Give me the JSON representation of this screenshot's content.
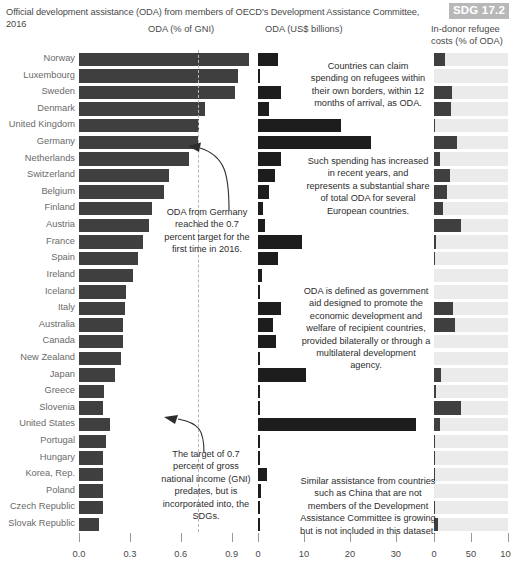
{
  "header": {
    "title": "Official development assistance (ODA) from members of OECD's Development Assistance Committee, 2016",
    "sdg_badge": "SDG 17.2"
  },
  "columns": {
    "gni": "ODA (% of GNI)",
    "usd": "ODA (US$ billions)",
    "refugee": "In-donor refugee costs (% of ODA)"
  },
  "notes": {
    "germany": "ODA from Germany reached the 0.7 percent target for the first time in 2016.",
    "target": "The target of 0.7 percent of gross national income (GNI) predates, but is incorporated into, the SDGs.",
    "refugees": "Countries can claim spending on refugees within their own borders, within 12 months of arrival, as ODA.",
    "spending": "Such spending has increased in recent years, and represents a substantial share of total ODA for several European countries.",
    "defined": "ODA is defined as government aid designed to promote the economic development and welfare of recipient countries, provided bilaterally or through a multilateral development agency.",
    "similar": "Similar assistance from countries such as China that are not members of the Development Assistance Committee is growing but is not included in this dataset."
  },
  "chart_data": {
    "type": "bar",
    "title": "Official development assistance (ODA) from members of OECD's Development Assistance Committee, 2016",
    "orientation": "horizontal",
    "categories": [
      "Norway",
      "Luxembourg",
      "Sweden",
      "Denmark",
      "United Kingdom",
      "Germany",
      "Netherlands",
      "Switzerland",
      "Belgium",
      "Finland",
      "Austria",
      "France",
      "Spain",
      "Ireland",
      "Iceland",
      "Italy",
      "Australia",
      "Canada",
      "New Zealand",
      "Japan",
      "Greece",
      "Slovenia",
      "United States",
      "Portugal",
      "Hungary",
      "Korea, Rep.",
      "Poland",
      "Czech Republic",
      "Slovak Republic"
    ],
    "panels": [
      {
        "name": "oda_pct_gni",
        "label": "ODA (% of GNI)",
        "xlabel": "",
        "ticks": [
          "0.0",
          "0.3",
          "0.6",
          "0.9"
        ],
        "tick_values": [
          0.0,
          0.3,
          0.6,
          0.9
        ],
        "xlim": [
          0,
          1.02
        ],
        "reference_line": 0.7,
        "values": [
          1.0,
          0.94,
          0.92,
          0.74,
          0.71,
          0.7,
          0.65,
          0.53,
          0.5,
          0.43,
          0.41,
          0.38,
          0.35,
          0.32,
          0.28,
          0.27,
          0.26,
          0.26,
          0.25,
          0.21,
          0.15,
          0.14,
          0.18,
          0.16,
          0.14,
          0.14,
          0.14,
          0.14,
          0.12
        ]
      },
      {
        "name": "oda_usd_billions",
        "label": "ODA (US$ billions)",
        "xlabel": "",
        "ticks": [
          "0",
          "10",
          "20",
          "30"
        ],
        "tick_values": [
          0,
          10,
          20,
          30
        ],
        "xlim": [
          0,
          37
        ],
        "values": [
          4.4,
          0.4,
          4.9,
          2.4,
          18.0,
          24.7,
          5.0,
          3.6,
          2.3,
          1.1,
          1.6,
          9.6,
          4.3,
          0.8,
          0.06,
          5.0,
          3.3,
          4.0,
          0.44,
          10.4,
          0.37,
          0.08,
          34.4,
          0.34,
          0.2,
          2.0,
          0.66,
          0.26,
          0.11
        ]
      },
      {
        "name": "in_donor_refugee_costs_pct_oda",
        "label": "In-donor refugee costs (% of ODA)",
        "xlabel": "",
        "ticks": [
          "0",
          "50",
          "100"
        ],
        "tick_values": [
          0,
          50,
          100
        ],
        "xlim": [
          0,
          100
        ],
        "track_full": true,
        "values": [
          14.5,
          0.0,
          24.0,
          23.0,
          2.0,
          31.0,
          8.0,
          21.0,
          18.0,
          12.0,
          37.0,
          3.0,
          1.5,
          0.0,
          0.0,
          26.0,
          28.0,
          0.0,
          0.0,
          9.5,
          3.0,
          36.0,
          7.5,
          2.0,
          1.5,
          2.0,
          0.0,
          1.0,
          6.0
        ]
      }
    ]
  }
}
